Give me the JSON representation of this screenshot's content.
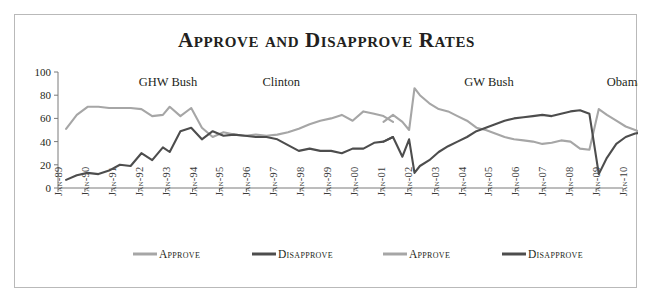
{
  "title": "Approve and Disapprove Rates",
  "colors": {
    "approve": "#a6a6a6",
    "disapprove": "#4d4d4d",
    "axis": "#7a7a7a",
    "border": "#b9b9b9",
    "text": "#231f20",
    "background": "#ffffff"
  },
  "annotations": [
    {
      "label": "GHW Bush",
      "x": 3.0,
      "y": 88
    },
    {
      "label": "Clinton",
      "x": 7.6,
      "y": 88
    },
    {
      "label": "GW Bush",
      "x": 15.1,
      "y": 88
    },
    {
      "label": "Obama",
      "x": 20.4,
      "y": 88
    }
  ],
  "legend": [
    {
      "label": "Approve",
      "color": "#a6a6a6"
    },
    {
      "label": "Disapprove",
      "color": "#4d4d4d"
    },
    {
      "label": "Approve",
      "color": "#a6a6a6"
    },
    {
      "label": "Disapprove",
      "color": "#4d4d4d"
    }
  ],
  "chart_data": {
    "type": "line",
    "title": "Approve and Disapprove Rates",
    "xlabel": "",
    "ylabel": "",
    "ylim": [
      0,
      100
    ],
    "yticks": [
      0,
      20,
      40,
      60,
      80,
      100
    ],
    "grid": false,
    "legend_position": "bottom",
    "categories": [
      "Jan-89",
      "Jan-90",
      "Jan-91",
      "Jan-92",
      "Jan-93",
      "Jan-94",
      "Jan-95",
      "Jan-96",
      "Jan-97",
      "Jan-98",
      "Jan-99",
      "Jan-00",
      "Jan-01",
      "Jan-02",
      "Jan-03",
      "Jan-04",
      "Jan-05",
      "Jan-06",
      "Jan-07",
      "Jan-08",
      "Jan-09",
      "Jan-10"
    ],
    "series": [
      {
        "name": "Approve",
        "group": "GHW Bush / Clinton",
        "color": "#a6a6a6",
        "x": [
          0.3,
          0.7,
          1.1,
          1.5,
          1.9,
          2.3,
          2.7,
          3.1,
          3.5,
          3.9,
          4.15,
          4.55,
          4.95,
          5.35,
          5.75,
          6.15,
          6.55,
          6.95,
          7.35,
          7.75,
          8.15,
          8.55,
          8.95,
          9.35,
          9.75,
          10.15,
          10.55,
          10.95,
          11.35,
          11.75,
          12.1,
          12.45
        ],
        "values": [
          51,
          63,
          70,
          70,
          69,
          69,
          69,
          68,
          62,
          63,
          70,
          62,
          69,
          52,
          44,
          48,
          46,
          45,
          46,
          45,
          46,
          48,
          51,
          55,
          58,
          60,
          63,
          58,
          66,
          64,
          62,
          57
        ]
      },
      {
        "name": "Disapprove",
        "group": "GHW Bush / Clinton",
        "color": "#4d4d4d",
        "x": [
          0.3,
          0.7,
          1.1,
          1.5,
          1.9,
          2.3,
          2.7,
          3.1,
          3.5,
          3.9,
          4.15,
          4.55,
          4.95,
          5.35,
          5.75,
          6.15,
          6.55,
          6.95,
          7.35,
          7.75,
          8.15,
          8.55,
          8.95,
          9.35,
          9.75,
          10.15,
          10.55,
          10.95,
          11.35,
          11.75,
          12.1,
          12.45
        ],
        "values": [
          7,
          11,
          13,
          12,
          15,
          20,
          19,
          30,
          24,
          35,
          31,
          49,
          52,
          42,
          49,
          45,
          46,
          45,
          44,
          44,
          42,
          37,
          32,
          34,
          32,
          32,
          30,
          34,
          34,
          39,
          40,
          44
        ]
      },
      {
        "name": "Approve",
        "group": "GW Bush / Obama",
        "color": "#a6a6a6",
        "x": [
          12.1,
          12.45,
          12.8,
          13.05,
          13.25,
          13.45,
          13.8,
          14.15,
          14.5,
          14.85,
          15.2,
          15.55,
          15.9,
          16.25,
          16.6,
          16.95,
          17.3,
          17.65,
          18.0,
          18.35,
          18.7,
          19.05,
          19.4,
          19.75,
          20.1,
          20.4,
          20.75,
          21.1,
          21.45,
          21.8
        ],
        "values": [
          57,
          63,
          57,
          50,
          86,
          80,
          73,
          68,
          66,
          62,
          58,
          52,
          50,
          47,
          44,
          42,
          41,
          40,
          38,
          39,
          41,
          40,
          34,
          33,
          68,
          63,
          58,
          53,
          50,
          47
        ]
      },
      {
        "name": "Disapprove",
        "group": "GW Bush / Obama",
        "color": "#4d4d4d",
        "x": [
          12.1,
          12.45,
          12.8,
          13.05,
          13.25,
          13.45,
          13.8,
          14.15,
          14.5,
          14.85,
          15.2,
          15.55,
          15.9,
          16.25,
          16.6,
          16.95,
          17.3,
          17.65,
          18.0,
          18.35,
          18.7,
          19.05,
          19.4,
          19.75,
          20.1,
          20.4,
          20.75,
          21.1,
          21.45,
          21.8
        ],
        "values": [
          40,
          44,
          27,
          42,
          13,
          19,
          24,
          31,
          36,
          40,
          44,
          49,
          52,
          55,
          58,
          60,
          61,
          62,
          63,
          62,
          64,
          66,
          67,
          64,
          12,
          26,
          38,
          44,
          47,
          48
        ]
      }
    ]
  }
}
